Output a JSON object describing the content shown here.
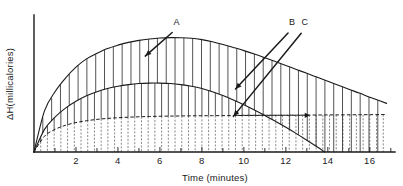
{
  "chart_data": {
    "type": "area",
    "title": "",
    "xlabel": "Time (minutes)",
    "ylabel": "ΔH(millicalories)",
    "xlim": [
      0,
      17.2
    ],
    "ylim": [
      0,
      1.0
    ],
    "grid": false,
    "legend_position": "inline-annotations",
    "x_ticks_major": [
      2,
      4,
      6,
      8,
      10,
      12,
      14,
      16
    ],
    "x_ticks_minor_interval": 1,
    "x_tick_labels": [
      "2",
      "4",
      "6",
      "8",
      "10",
      "12",
      "14",
      "16"
    ],
    "y_ticks": [],
    "y_tick_labels": [],
    "annotations": [
      {
        "label": "A",
        "x": 6.8,
        "y_text": 0.93,
        "target_x": 5.3,
        "target_y": 0.7
      },
      {
        "label": "B",
        "x": 12.3,
        "y_text": 0.93,
        "target_x": 9.6,
        "target_y": 0.46
      },
      {
        "label": "C",
        "x": 18.0,
        "y_text": 0.93,
        "target_x": 9.5,
        "target_y": 0.26
      }
    ],
    "series": [
      {
        "name": "A",
        "style": "solid",
        "fill": "vertical-hatch-solid",
        "x": [
          0,
          0.5,
          1,
          1.5,
          2,
          2.5,
          3,
          3.5,
          4,
          4.5,
          5,
          5.5,
          6,
          6.5,
          7,
          7.5,
          8,
          8.5,
          9,
          9.5,
          10,
          10.5,
          11,
          11.5,
          12,
          12.5,
          13,
          13.5,
          14,
          14.5,
          15,
          15.5,
          16,
          16.5,
          16.8
        ],
        "values": [
          0.0,
          0.3,
          0.44,
          0.54,
          0.62,
          0.68,
          0.72,
          0.755,
          0.78,
          0.8,
          0.815,
          0.825,
          0.832,
          0.835,
          0.834,
          0.83,
          0.82,
          0.805,
          0.785,
          0.763,
          0.74,
          0.715,
          0.688,
          0.66,
          0.632,
          0.603,
          0.574,
          0.545,
          0.516,
          0.487,
          0.458,
          0.43,
          0.4,
          0.372,
          0.355
        ]
      },
      {
        "name": "B",
        "style": "solid",
        "fill": "vertical-hatch-solid",
        "x": [
          0,
          0.5,
          1,
          1.5,
          2,
          2.5,
          3,
          3.5,
          4,
          4.5,
          5,
          5.5,
          6,
          6.5,
          7,
          7.5,
          8,
          8.5,
          9,
          9.5,
          10,
          10.5,
          11,
          11.5,
          12,
          12.5,
          13,
          13.5,
          13.85
        ],
        "values": [
          0.0,
          0.165,
          0.255,
          0.32,
          0.37,
          0.41,
          0.44,
          0.463,
          0.48,
          0.492,
          0.5,
          0.503,
          0.503,
          0.5,
          0.492,
          0.48,
          0.463,
          0.44,
          0.412,
          0.38,
          0.345,
          0.307,
          0.267,
          0.224,
          0.18,
          0.134,
          0.086,
          0.036,
          0.0
        ]
      },
      {
        "name": "C",
        "style": "dashed",
        "fill": "vertical-hatch-dashed",
        "x": [
          0,
          0.5,
          1,
          1.5,
          2,
          2.5,
          3,
          3.5,
          4,
          4.5,
          5,
          5.5,
          6,
          6.5,
          7,
          7.5,
          8,
          8.5,
          9,
          9.5,
          10,
          10.5,
          11,
          11.5,
          12,
          12.5,
          13,
          13.5,
          14,
          14.5,
          15,
          15.5,
          16,
          16.5,
          16.8
        ],
        "values": [
          0.0,
          0.115,
          0.165,
          0.195,
          0.215,
          0.228,
          0.238,
          0.245,
          0.25,
          0.254,
          0.257,
          0.259,
          0.261,
          0.262,
          0.263,
          0.264,
          0.2645,
          0.265,
          0.2655,
          0.266,
          0.2665,
          0.267,
          0.2675,
          0.268,
          0.2685,
          0.269,
          0.2695,
          0.27,
          0.2705,
          0.271,
          0.2715,
          0.272,
          0.2725,
          0.273,
          0.2735
        ]
      }
    ]
  },
  "axis": {
    "x_title": "Time (minutes)",
    "y_title": "ΔH(millicalories)"
  },
  "labels": {
    "a": "A",
    "b": "B",
    "c": "C"
  }
}
